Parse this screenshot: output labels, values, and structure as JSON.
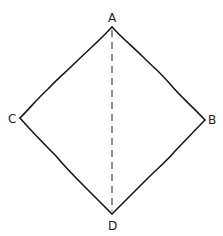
{
  "diagram": {
    "type": "quadrilateral",
    "shape": "rhombus / square rotated 45 degrees",
    "vertices": [
      {
        "name": "A",
        "label": "A",
        "position": "top"
      },
      {
        "name": "B",
        "label": "B",
        "position": "right"
      },
      {
        "name": "C",
        "label": "C",
        "position": "left"
      },
      {
        "name": "D",
        "label": "D",
        "position": "bottom"
      }
    ],
    "edges": [
      "AB",
      "BD",
      "DC",
      "CA"
    ],
    "diagonals": [
      {
        "from": "A",
        "to": "D",
        "style": "dashed"
      }
    ],
    "colors": {
      "stroke": "#1a1a1a",
      "background": "#ffffff"
    }
  },
  "labels": {
    "a": "A",
    "b": "B",
    "c": "C",
    "d": "D"
  }
}
